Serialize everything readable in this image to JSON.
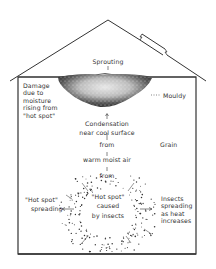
{
  "colors": {
    "ink": "#333333",
    "background": "#ffffff",
    "mould": "#444444"
  },
  "labels": {
    "sprouting": "Sprouting",
    "damage": [
      "Damage",
      "due to",
      "moisture",
      "rising from",
      "\"hot spot\""
    ],
    "mouldy": "Mouldy",
    "condensation": [
      "Condensation",
      "near cool surface"
    ],
    "from1": "from",
    "warm_air": "warm moist air",
    "from2": "from",
    "grain": "Grain",
    "hotspot_center": [
      "\"Hot spot\"",
      "caused",
      "by insects"
    ],
    "hotspot_spreading": [
      "\"Hot spot\"",
      "spreading"
    ],
    "insects_spreading": [
      "Insects",
      "spreading",
      "as heat",
      "increases"
    ]
  }
}
